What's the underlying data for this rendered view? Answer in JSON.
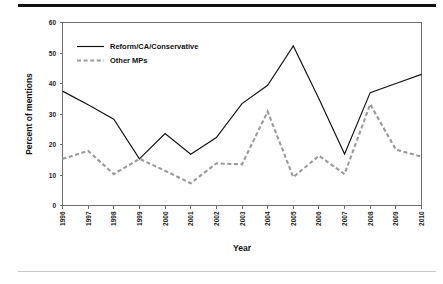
{
  "chart_data": {
    "type": "line",
    "title": "",
    "xlabel": "Year",
    "ylabel": "Percent of mentions",
    "categories": [
      "1996",
      "1997",
      "1998",
      "1999",
      "2000",
      "2001",
      "2002",
      "2003",
      "2004",
      "2005",
      "2006",
      "2007",
      "2008",
      "2009",
      "2010"
    ],
    "x": [
      1996,
      1997,
      1998,
      1999,
      2000,
      2001,
      2002,
      2003,
      2004,
      2005,
      2006,
      2007,
      2008,
      2009,
      2010
    ],
    "series": [
      {
        "name": "Reform/CA/Conservative",
        "style": "solid",
        "color": "#111111",
        "values": [
          37.5,
          33.0,
          28.3,
          15.3,
          23.6,
          16.8,
          22.3,
          33.4,
          39.4,
          52.3,
          35.0,
          16.9,
          37.0,
          40.0,
          43.0
        ]
      },
      {
        "name": "Other MPs",
        "style": "dashed",
        "color": "#9a9a9a",
        "values": [
          15.3,
          17.9,
          10.3,
          15.3,
          11.4,
          7.3,
          13.8,
          13.5,
          30.8,
          9.3,
          16.3,
          10.3,
          33.2,
          18.3,
          16.0
        ]
      }
    ],
    "ylim": [
      0,
      60
    ],
    "yticks": [
      0,
      10,
      20,
      30,
      40,
      50,
      60
    ],
    "ytick_labels": [
      "0",
      "10",
      "20",
      "30",
      "40",
      "50",
      "60"
    ],
    "grid": false,
    "legend_position": "top-left",
    "legend": [
      "Reform/CA/Conservative",
      "Other MPs"
    ]
  },
  "figure": {
    "top_rule_color": "#111111",
    "bottom_rule_color": "#c9c9c9",
    "background": "#ffffff",
    "axis_color": "#6f6f6f"
  }
}
